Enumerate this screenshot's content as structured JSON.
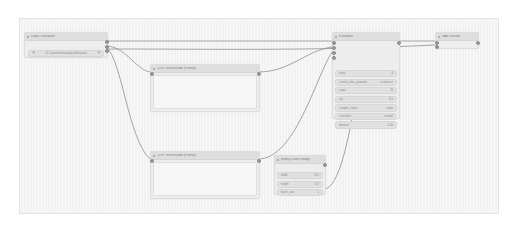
{
  "app": {
    "name": "ComfyUI",
    "canvas_background": "#f2f2f2",
    "node_background": "#ededed",
    "node_header": "#dedede",
    "link_color": "#9a9a9a"
  },
  "nodes": {
    "load_checkpoint": {
      "title": "Load Checkpoint",
      "widgets": [
        {
          "label": "ckpt_name",
          "value": "v1-5-pruned-emaonly.safetensors"
        }
      ],
      "outputs": [
        "MODEL",
        "CLIP",
        "VAE"
      ]
    },
    "clip_positive": {
      "title": "CLIP Text Encode (Prompt)",
      "text": "",
      "inputs": [
        "clip"
      ],
      "outputs": [
        "CONDITIONING"
      ]
    },
    "clip_negative": {
      "title": "CLIP Text Encode (Prompt)",
      "text": "",
      "inputs": [
        "clip"
      ],
      "outputs": [
        "CONDITIONING"
      ]
    },
    "ksampler": {
      "title": "KSampler",
      "inputs": [
        "model",
        "positive",
        "negative",
        "latent_image"
      ],
      "outputs": [
        "LATENT"
      ],
      "widgets": [
        {
          "label": "seed",
          "value": "0"
        },
        {
          "label": "control_after_generate",
          "value": "randomize"
        },
        {
          "label": "steps",
          "value": "20"
        },
        {
          "label": "cfg",
          "value": "8.0"
        },
        {
          "label": "sampler_name",
          "value": "euler"
        },
        {
          "label": "scheduler",
          "value": "normal"
        },
        {
          "label": "denoise",
          "value": "1.00"
        }
      ]
    },
    "empty_latent": {
      "title": "Empty Latent Image",
      "outputs": [
        "LATENT"
      ],
      "widgets": [
        {
          "label": "width",
          "value": "512"
        },
        {
          "label": "height",
          "value": "512"
        },
        {
          "label": "batch_size",
          "value": "1"
        }
      ]
    },
    "vae_decode": {
      "title": "VAE Decode",
      "inputs": [
        "samples",
        "vae"
      ],
      "outputs": [
        "IMAGE"
      ]
    }
  }
}
